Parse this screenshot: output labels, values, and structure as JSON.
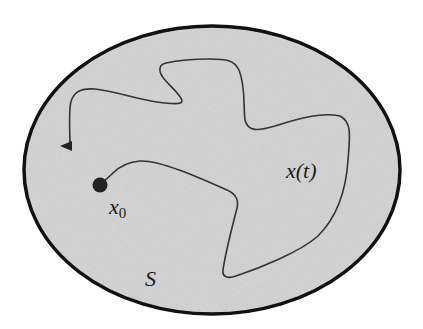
{
  "diagram": {
    "type": "trajectory-in-region",
    "region": {
      "label": "S",
      "shape": "ellipse",
      "fill": "#d9d9d9",
      "stroke": "#111111"
    },
    "start_point": {
      "label_base": "x",
      "label_sub": "0",
      "color": "#222222"
    },
    "trajectory": {
      "label": "x(t)",
      "stroke": "#333333",
      "has_arrowhead": true
    }
  }
}
